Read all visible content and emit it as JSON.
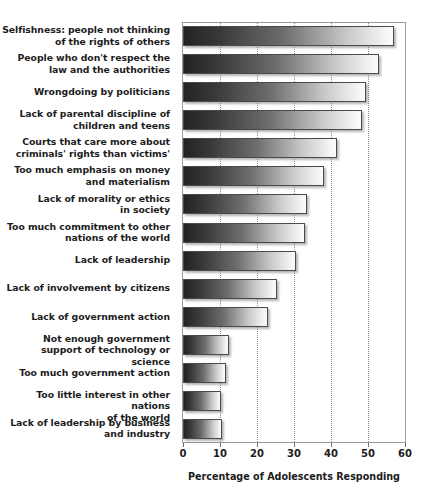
{
  "chart_data": {
    "type": "bar",
    "orientation": "horizontal",
    "title": "",
    "subtitle": "",
    "xlabel": "Percentage of Adolescents Responding",
    "ylabel": "",
    "xlim": [
      0,
      60
    ],
    "xticks": [
      0,
      10,
      20,
      30,
      40,
      50,
      60
    ],
    "xtick_labels": [
      "0",
      "10",
      "20",
      "30",
      "40",
      "50",
      "60"
    ],
    "grid": "vertical-dotted",
    "legend": null,
    "categories": [
      "Selfishness: people not thinking of the rights of others",
      "People who don't respect the law and the authorities",
      "Wrongdoing by politicians",
      "Lack of parental discipline of children and teens",
      "Courts that care more about criminals' rights than victims'",
      "Too much emphasis on money and materialism",
      "Lack of morality or ethics in society",
      "Too much commitment to other nations of the world",
      "Lack of leadership",
      "Lack of involvement by citizens",
      "Lack of government action",
      "Not enough government support of technology or science",
      "Too much government action",
      "Too little interest in other nations of the world",
      "Lack of leadership by business and industry"
    ],
    "category_lines": [
      [
        "Selfishness: people not thinking",
        "of the rights of others"
      ],
      [
        "People who don't respect the",
        "law and the authorities"
      ],
      [
        "Wrongdoing by politicians"
      ],
      [
        "Lack of parental discipline of",
        "children and teens"
      ],
      [
        "Courts that care more about",
        "criminals' rights than victims'"
      ],
      [
        "Too much emphasis on money",
        "and materialism"
      ],
      [
        "Lack of morality or ethics",
        "in society"
      ],
      [
        "Too much commitment to other",
        "nations of the world"
      ],
      [
        "Lack of leadership"
      ],
      [
        "Lack of involvement by citizens"
      ],
      [
        "Lack of government action"
      ],
      [
        "Not enough government",
        "support of technology or science"
      ],
      [
        "Too much government action"
      ],
      [
        "Too little interest in other nations",
        "of the world"
      ],
      [
        "Lack of leadership by business",
        "and industry"
      ]
    ],
    "values": [
      57,
      53,
      49.5,
      48.5,
      41.5,
      38,
      33.5,
      33,
      30.5,
      25.5,
      23,
      12.5,
      11.5,
      10.3,
      10.5
    ],
    "bar_gradient_from": "#232323",
    "bar_gradient_to": "#fbfbfb",
    "bar_border_color": "#4a4a4a",
    "frame_color": "#9a9a9a",
    "grid_color": "#8c8c8c",
    "text_color": "#1c1c1c",
    "background": "#ffffff"
  }
}
